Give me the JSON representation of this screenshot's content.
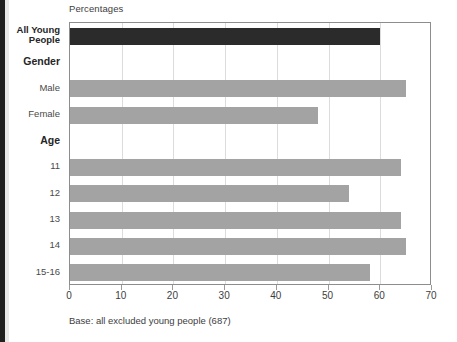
{
  "chart_data": {
    "type": "bar",
    "orientation": "horizontal",
    "title": "",
    "xlabel": "Percentages",
    "ylabel": "",
    "xlim": [
      0,
      70
    ],
    "xticks": [
      0,
      10,
      20,
      30,
      40,
      50,
      60,
      70
    ],
    "xtick_labels": [
      "0",
      "10",
      "20",
      "30",
      "40",
      "50",
      "60",
      "70"
    ],
    "grid": true,
    "legend": false,
    "note": "Base: all excluded young people (687)",
    "rows": [
      {
        "label": "All Young\nPeople",
        "value": 60,
        "style": "total",
        "color": "#2b2b2b"
      },
      {
        "label": "Gender",
        "value": null,
        "style": "header",
        "color": ""
      },
      {
        "label": "Male",
        "value": 65,
        "style": "bar",
        "color": "#a3a3a3"
      },
      {
        "label": "Female",
        "value": 48,
        "style": "bar",
        "color": "#a3a3a3"
      },
      {
        "label": "Age",
        "value": null,
        "style": "header",
        "color": ""
      },
      {
        "label": "11",
        "value": 64,
        "style": "bar",
        "color": "#a3a3a3"
      },
      {
        "label": "12",
        "value": 54,
        "style": "bar",
        "color": "#a3a3a3"
      },
      {
        "label": "13",
        "value": 64,
        "style": "bar",
        "color": "#a3a3a3"
      },
      {
        "label": "14",
        "value": 65,
        "style": "bar",
        "color": "#a3a3a3"
      },
      {
        "label": "15-16",
        "value": 58,
        "style": "bar",
        "color": "#a3a3a3"
      }
    ],
    "categories": [
      "All Young People",
      "Male",
      "Female",
      "11",
      "12",
      "13",
      "14",
      "15-16"
    ],
    "values": [
      60,
      65,
      48,
      64,
      54,
      64,
      65,
      58
    ]
  },
  "axis_title": "Percentages",
  "base_note": "Base: all excluded young people (687)",
  "colors": {
    "total_bar": "#2b2b2b",
    "bar": "#a3a3a3",
    "gridline": "#dcdcdc",
    "frame": "#8d8d8d"
  }
}
